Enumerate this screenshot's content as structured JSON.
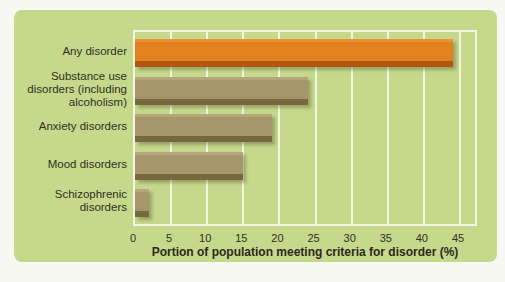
{
  "chart_data": {
    "type": "bar",
    "orientation": "horizontal",
    "xlabel": "Portion of population meeting criteria for disorder (%)",
    "categories": [
      "Any disorder",
      "Substance use disorders (including alcoholism)",
      "Anxiety disorders",
      "Mood disorders",
      "Schizophrenic disorders"
    ],
    "values": [
      44,
      24,
      19,
      15,
      2
    ],
    "highlight_index": 0,
    "xlim": [
      0,
      45
    ],
    "xticks": [
      0,
      5,
      10,
      15,
      20,
      25,
      30,
      35,
      40,
      45
    ],
    "grid": "vertical-white-gridlines-every-5",
    "legend": "none",
    "colors": {
      "highlight_bar": "#e2811e",
      "highlight_bar_top": "#ea9334",
      "highlight_bar_dark": "#b2570d",
      "default_bar": "#a6966a",
      "default_bar_top": "#b5a67b",
      "default_bar_dark": "#77683f",
      "card_background": "#c5d88c",
      "page_background": "#f7f8f1",
      "gridline": "#f2f5e0",
      "text": "#32301e"
    }
  }
}
